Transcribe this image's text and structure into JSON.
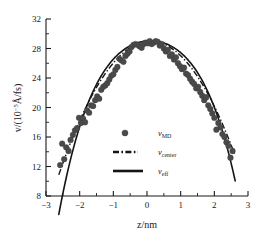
{
  "chart_data": {
    "type": "scatter",
    "title": "",
    "xlabel": "z/nm",
    "ylabel_prefix": "v/(10",
    "ylabel_exponent": "−5",
    "ylabel_suffix": "Å/fs)",
    "ylabel_full": "v/(10−5Å/fs)",
    "xlim": [
      -3,
      3
    ],
    "ylim": [
      8,
      32
    ],
    "xticks": [
      -3,
      -2,
      -1,
      0,
      1,
      2,
      3
    ],
    "xtick_labels": [
      "−3",
      "−2",
      "−1",
      "0",
      "1",
      "2",
      "3"
    ],
    "yticks": [
      8,
      12,
      16,
      20,
      24,
      28,
      32
    ],
    "ytick_labels": [
      "8",
      "12",
      "16",
      "20",
      "24",
      "28",
      "32"
    ],
    "x_minor_interval": 0.5,
    "y_minor_interval": 2,
    "grid": false,
    "legend_position": "center",
    "series": [
      {
        "name": "v_MD",
        "label_base": "v",
        "label_sub": "MD",
        "style": "marker",
        "marker": "circle",
        "color": "#4a4a4a",
        "points": [
          [
            -2.58,
            12.2
          ],
          [
            -2.52,
            15.1
          ],
          [
            -2.46,
            13.0
          ],
          [
            -2.4,
            14.6
          ],
          [
            -2.33,
            14.1
          ],
          [
            -2.27,
            15.6
          ],
          [
            -2.2,
            16.3
          ],
          [
            -2.14,
            16.9
          ],
          [
            -2.08,
            17.2
          ],
          [
            -2.02,
            18.6
          ],
          [
            -1.96,
            17.9
          ],
          [
            -1.9,
            18.5
          ],
          [
            -1.84,
            18.0
          ],
          [
            -1.78,
            19.6
          ],
          [
            -1.72,
            19.3
          ],
          [
            -1.66,
            20.3
          ],
          [
            -1.6,
            20.2
          ],
          [
            -1.54,
            21.0
          ],
          [
            -1.48,
            21.5
          ],
          [
            -1.42,
            21.2
          ],
          [
            -1.36,
            22.4
          ],
          [
            -1.3,
            22.8
          ],
          [
            -1.24,
            23.0
          ],
          [
            -1.18,
            23.3
          ],
          [
            -1.12,
            23.8
          ],
          [
            -1.06,
            24.3
          ],
          [
            -1.0,
            24.5
          ],
          [
            -0.94,
            25.1
          ],
          [
            -0.88,
            25.5
          ],
          [
            -0.82,
            26.6
          ],
          [
            -0.76,
            26.4
          ],
          [
            -0.7,
            26.2
          ],
          [
            -0.64,
            27.0
          ],
          [
            -0.58,
            27.3
          ],
          [
            -0.52,
            27.6
          ],
          [
            -0.46,
            28.2
          ],
          [
            -0.4,
            28.5
          ],
          [
            -0.34,
            28.6
          ],
          [
            -0.28,
            28.5
          ],
          [
            -0.22,
            28.3
          ],
          [
            -0.16,
            28.1
          ],
          [
            -0.1,
            28.6
          ],
          [
            -0.04,
            28.8
          ],
          [
            0.02,
            28.7
          ],
          [
            0.08,
            29.0
          ],
          [
            0.14,
            28.6
          ],
          [
            0.2,
            28.8
          ],
          [
            0.26,
            29.0
          ],
          [
            0.32,
            28.9
          ],
          [
            0.38,
            28.4
          ],
          [
            0.44,
            28.6
          ],
          [
            0.5,
            28.0
          ],
          [
            0.56,
            27.6
          ],
          [
            0.62,
            27.8
          ],
          [
            0.68,
            27.0
          ],
          [
            0.74,
            27.2
          ],
          [
            0.8,
            26.5
          ],
          [
            0.86,
            26.8
          ],
          [
            0.92,
            26.0
          ],
          [
            0.98,
            25.6
          ],
          [
            1.04,
            25.2
          ],
          [
            1.1,
            25.4
          ],
          [
            1.16,
            24.6
          ],
          [
            1.22,
            24.4
          ],
          [
            1.28,
            23.9
          ],
          [
            1.34,
            23.5
          ],
          [
            1.4,
            23.2
          ],
          [
            1.46,
            22.6
          ],
          [
            1.52,
            22.8
          ],
          [
            1.58,
            22.1
          ],
          [
            1.64,
            21.6
          ],
          [
            1.7,
            21.0
          ],
          [
            1.76,
            21.4
          ],
          [
            1.82,
            20.3
          ],
          [
            1.88,
            19.8
          ],
          [
            1.94,
            19.2
          ],
          [
            2.0,
            18.6
          ],
          [
            2.06,
            17.0
          ],
          [
            2.12,
            17.9
          ],
          [
            2.18,
            17.3
          ],
          [
            2.24,
            16.4
          ],
          [
            2.3,
            16.0
          ],
          [
            2.36,
            15.3
          ],
          [
            2.42,
            14.8
          ],
          [
            2.48,
            13.2
          ],
          [
            2.54,
            14.1
          ]
        ]
      },
      {
        "name": "v_center",
        "label_base": "v",
        "label_sub": "center",
        "style": "dash-dot",
        "color": "#141414",
        "description": "Parabolic fit anchored at centre, wider tails",
        "curve": {
          "form": "parabola",
          "vertex_x": 0.1,
          "vertex_y": 29.0,
          "a": -2.45,
          "x_range": [
            -2.62,
            2.62
          ]
        }
      },
      {
        "name": "v_eff",
        "label_base": "v",
        "label_sub": "eff",
        "style": "solid",
        "color": "#141414",
        "description": "Effective-slip fit, falls faster at the walls",
        "curve": {
          "form": "quartic",
          "vertex_x": 0.1,
          "vertex_y": 29.05,
          "a": -1.85,
          "b": -0.18,
          "x_range": [
            -2.62,
            2.62
          ]
        }
      }
    ]
  },
  "legend": {
    "items": [
      {
        "marker": "circle",
        "label_base": "v",
        "label_sub": "MD"
      },
      {
        "marker": "dash-dot-line",
        "label_base": "v",
        "label_sub": "center"
      },
      {
        "marker": "solid-line",
        "label_base": "v",
        "label_sub": "eff"
      }
    ]
  },
  "colors": {
    "axis": "#1a1a1a",
    "marker": "#4a4a4a",
    "line": "#141414",
    "background": "#ffffff"
  }
}
